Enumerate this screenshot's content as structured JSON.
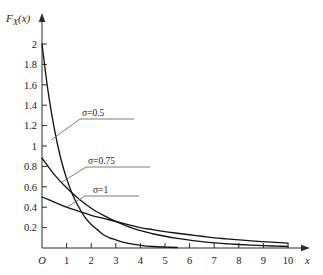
{
  "chart_data": {
    "type": "line",
    "title": "",
    "subtitle": "",
    "xlabel": "x",
    "ylabel": "F_X(x)",
    "ylabel_base": "F",
    "ylabel_sub": "X",
    "ylabel_arg": "(x)",
    "origin_label": "O",
    "xlim": [
      0,
      10
    ],
    "ylim": [
      0,
      2
    ],
    "grid": false,
    "legend_position": "inline-annotations",
    "x_ticks": [
      1,
      2,
      3,
      4,
      5,
      6,
      7,
      8,
      9,
      10
    ],
    "x_tick_labels": [
      "1",
      "2",
      "3",
      "4",
      "5",
      "6",
      "7",
      "8",
      "9",
      "10"
    ],
    "y_ticks": [
      0.2,
      0.4,
      0.6,
      0.8,
      1,
      1.2,
      1.4,
      1.6,
      1.8,
      2
    ],
    "y_tick_labels": [
      "0.2",
      "0.4",
      "0.6",
      "0.8",
      "1",
      "1.2",
      "1.4",
      "1.6",
      "1.8",
      "2"
    ],
    "axis_color": "#2b2b2b",
    "curve_color": "#141414",
    "leader_color": "#6d6d6d",
    "background_color": "#ffffff",
    "series": [
      {
        "name": "sigma=0.5",
        "label": "σ=0.5",
        "sigma": 0.5,
        "x": [
          0,
          0.25,
          0.5,
          0.75,
          1,
          1.25,
          1.5,
          1.75,
          2,
          2.25,
          2.5,
          2.75,
          3,
          3.25,
          3.5,
          3.75,
          4,
          4.5,
          5,
          5.5
        ],
        "values": [
          2,
          1.53,
          1.17,
          0.89,
          0.68,
          0.52,
          0.4,
          0.3,
          0.23,
          0.18,
          0.13,
          0.1,
          0.08,
          0.06,
          0.045,
          0.035,
          0.026,
          0.015,
          0.009,
          0.005
        ]
      },
      {
        "name": "sigma=0.75",
        "label": "σ=0.75",
        "sigma": 0.75,
        "x": [
          0,
          0.5,
          1,
          1.5,
          2,
          2.5,
          3,
          3.5,
          4,
          4.5,
          5,
          5.5,
          6,
          6.5,
          7,
          7.5,
          8,
          8.5,
          9,
          9.5,
          10
        ],
        "values": [
          0.88,
          0.72,
          0.59,
          0.48,
          0.39,
          0.32,
          0.26,
          0.21,
          0.17,
          0.14,
          0.115,
          0.094,
          0.077,
          0.063,
          0.051,
          0.042,
          0.034,
          0.028,
          0.023,
          0.019,
          0.015
        ]
      },
      {
        "name": "sigma=1",
        "label": "σ=1",
        "sigma": 1,
        "x": [
          0,
          0.5,
          1,
          1.5,
          2,
          2.5,
          3,
          3.5,
          4,
          4.5,
          5,
          5.5,
          6,
          6.5,
          7,
          7.5,
          8,
          8.5,
          9,
          9.5,
          10
        ],
        "values": [
          0.5,
          0.45,
          0.4,
          0.36,
          0.32,
          0.29,
          0.26,
          0.23,
          0.2,
          0.18,
          0.16,
          0.145,
          0.13,
          0.115,
          0.1,
          0.09,
          0.08,
          0.07,
          0.062,
          0.055,
          0.048
        ]
      }
    ],
    "annotations": [
      {
        "text": "σ=0.5",
        "label_x": 2.85,
        "label_y": 1.52
      },
      {
        "text": "σ=0.75",
        "label_x": 2.85,
        "label_y": 0.875
      },
      {
        "text": "σ=1",
        "label_x": 2.85,
        "label_y": 0.6
      }
    ]
  }
}
